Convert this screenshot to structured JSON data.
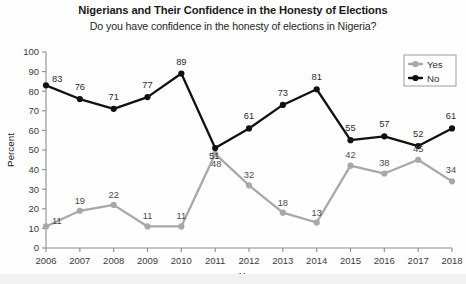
{
  "chart_data": {
    "type": "line",
    "title": "Nigerians and Their Confidence in the Honesty of Elections",
    "subtitle": "Do you have confidence in the honesty of elections in Nigeria?",
    "xlabel": "Year",
    "ylabel": "Percent",
    "categories": [
      2006,
      2007,
      2008,
      2009,
      2010,
      2011,
      2012,
      2013,
      2014,
      2015,
      2016,
      2017,
      2018
    ],
    "xtick_labels": [
      "2006",
      "2007",
      "2008",
      "2009",
      "2010",
      "2011",
      "2012",
      "2013",
      "2014",
      "2015",
      "2016",
      "2017",
      "2018"
    ],
    "ytick_labels": [
      "0",
      "10",
      "20",
      "30",
      "40",
      "50",
      "60",
      "70",
      "80",
      "90",
      "100"
    ],
    "ylim": [
      0,
      100
    ],
    "ytick_step": 10,
    "grid": false,
    "legend_position": "top-right",
    "series": [
      {
        "name": "Yes",
        "color": "#a8a8a8",
        "marker": "circle",
        "values": [
          11,
          19,
          22,
          11,
          11,
          48,
          32,
          18,
          13,
          42,
          38,
          45,
          34
        ]
      },
      {
        "name": "No",
        "color": "#111111",
        "marker": "circle",
        "values": [
          83,
          76,
          71,
          77,
          89,
          51,
          61,
          73,
          81,
          55,
          57,
          52,
          61
        ]
      }
    ]
  },
  "legend": {
    "items": [
      {
        "label": "Yes",
        "color": "#a8a8a8"
      },
      {
        "label": "No",
        "color": "#111111"
      }
    ]
  }
}
